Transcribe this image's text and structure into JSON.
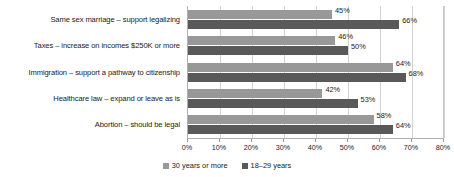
{
  "chart_data": {
    "type": "bar",
    "orientation": "horizontal",
    "title": "",
    "xlabel": "",
    "ylabel": "",
    "xlim": [
      0,
      80
    ],
    "xticks": [
      "0%",
      "10%",
      "20%",
      "30%",
      "40%",
      "50%",
      "60%",
      "70%",
      "80%"
    ],
    "xtick_values": [
      0,
      10,
      20,
      30,
      40,
      50,
      60,
      70,
      80
    ],
    "grid": true,
    "legend_position": "bottom",
    "categories": [
      "Same sex marriage – support legalizing",
      "Taxes – increase on incomes $250K or more",
      "Immigration – support a pathway to citizenship",
      "Healthcare law – expand or leave as is",
      "Abortion – should be legal"
    ],
    "series": [
      {
        "name": "30 years or more",
        "color": "#989898",
        "values": [
          45,
          46,
          64,
          42,
          58
        ],
        "labels": [
          "45%",
          "46%",
          "64%",
          "42%",
          "58%"
        ]
      },
      {
        "name": "18–29 years",
        "color": "#595959",
        "values": [
          66,
          50,
          68,
          53,
          64
        ],
        "labels": [
          "66%",
          "50%",
          "68%",
          "53%",
          "64%"
        ]
      }
    ]
  },
  "legend": {
    "items": [
      {
        "label": "30 years or more",
        "color": "#989898"
      },
      {
        "label": "18–29 years",
        "color": "#595959"
      }
    ]
  }
}
